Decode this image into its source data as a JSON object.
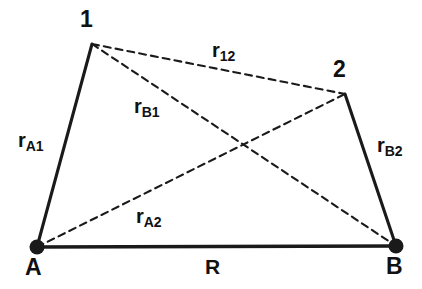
{
  "figure": {
    "type": "geometry-diagram",
    "width": 422,
    "height": 289,
    "background_color": "#ffffff",
    "stroke_color": "#1a1a1a"
  },
  "vertices": [
    {
      "id": "p1",
      "label": "1",
      "x": 92,
      "y": 44,
      "marker": "none",
      "label_x": 80,
      "label_y": 8
    },
    {
      "id": "p2",
      "label": "2",
      "x": 345,
      "y": 94,
      "marker": "none",
      "label_x": 333,
      "label_y": 58
    },
    {
      "id": "pA",
      "label": "A",
      "x": 37,
      "y": 247,
      "marker": "dot",
      "label_x": 25,
      "label_y": 256
    },
    {
      "id": "pB",
      "label": "B",
      "x": 396,
      "y": 246,
      "marker": "dot",
      "label_x": 386,
      "label_y": 255
    }
  ],
  "edges": [
    {
      "id": "e_A1",
      "from": "pA",
      "to": "p1",
      "style": "solid",
      "label": "r",
      "sub": "A1",
      "label_x": 18,
      "label_y": 130
    },
    {
      "id": "e_B2",
      "from": "pB",
      "to": "p2",
      "style": "solid",
      "label": "r",
      "sub": "B2",
      "label_x": 377,
      "label_y": 135
    },
    {
      "id": "e_AB",
      "from": "pA",
      "to": "pB",
      "style": "solid",
      "label": "R",
      "sub": "",
      "label_x": 205,
      "label_y": 256
    },
    {
      "id": "e_12",
      "from": "p1",
      "to": "p2",
      "style": "dashed",
      "label": "r",
      "sub": "12",
      "label_x": 212,
      "label_y": 40
    },
    {
      "id": "e_B1",
      "from": "p1",
      "to": "pB",
      "style": "dashed",
      "label": "r",
      "sub": "B1",
      "label_x": 134,
      "label_y": 96
    },
    {
      "id": "e_A2",
      "from": "pA",
      "to": "p2",
      "style": "dashed",
      "label": "r",
      "sub": "A2",
      "label_x": 136,
      "label_y": 206
    }
  ],
  "intersection": {
    "x": 242,
    "y": 145
  },
  "background_ghost_text": [
    "d· · m· e · b· · · ·",
    "· · s · · · · · ·",
    "· · · · · ·",
    "· · · · ·",
    "a· · · · · · t· ·",
    "· · · · ·",
    "· · 2 · ·",
    "· · · ·",
    "· · ·"
  ]
}
